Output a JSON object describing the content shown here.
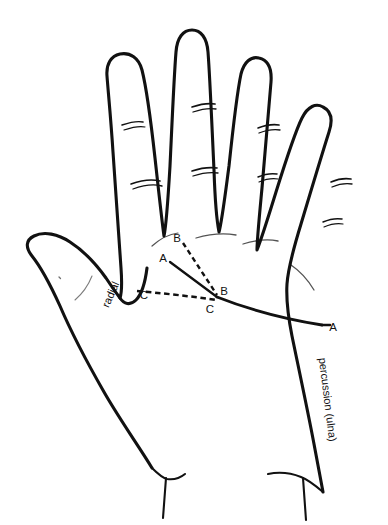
{
  "figure": {
    "background_color": "#ffffff",
    "ink_color": "#111111",
    "line_style": "black ink contour line drawing"
  },
  "edge_labels": [
    {
      "id": "radial-label",
      "text": "radial",
      "position": "along radial (thumb-side) border of index finger base",
      "rotation_deg": -66
    },
    {
      "id": "percussion-ulna-label",
      "text": "percussion (ulna)",
      "position": "along ulnar (little-finger-side) border of palm",
      "rotation_deg": 83
    }
  ],
  "point_labels": [
    {
      "id": "point-b-upper",
      "text": "B",
      "x": 177,
      "y": 238,
      "note": "proximal web between index and middle finger"
    },
    {
      "id": "point-a-upper",
      "text": "A",
      "x": 163,
      "y": 258,
      "note": "start of solid reference line"
    },
    {
      "id": "point-c-left",
      "text": "C",
      "x": 144,
      "y": 295,
      "note": "radial border point"
    },
    {
      "id": "point-b-lower",
      "text": "B",
      "x": 222,
      "y": 291,
      "note": "distal convergence point"
    },
    {
      "id": "point-c-lower",
      "text": "C",
      "x": 209,
      "y": 309,
      "note": "convergence point below B"
    },
    {
      "id": "point-a-right",
      "text": "A",
      "x": 327,
      "y": 327,
      "note": "ulnar border intersection"
    }
  ],
  "measurement_lines": [
    {
      "id": "line-b-to-b",
      "style": "dashed",
      "from": "B (upper)",
      "to": "B (lower)"
    },
    {
      "id": "line-c-to-c",
      "style": "dashed",
      "from": "C (left)",
      "to": "C (lower)"
    },
    {
      "id": "line-a-to-a",
      "style": "solid",
      "from": "A (upper)",
      "to": "A (right)"
    }
  ],
  "anatomy_parts": [
    {
      "id": "thumb",
      "creases": 1
    },
    {
      "id": "index-finger",
      "creases": 2
    },
    {
      "id": "middle-finger",
      "creases": 2
    },
    {
      "id": "ring-finger",
      "creases": 2
    },
    {
      "id": "little-finger",
      "creases": 2
    },
    {
      "id": "palm",
      "creases": 4
    },
    {
      "id": "wrist",
      "creases": 2
    }
  ]
}
